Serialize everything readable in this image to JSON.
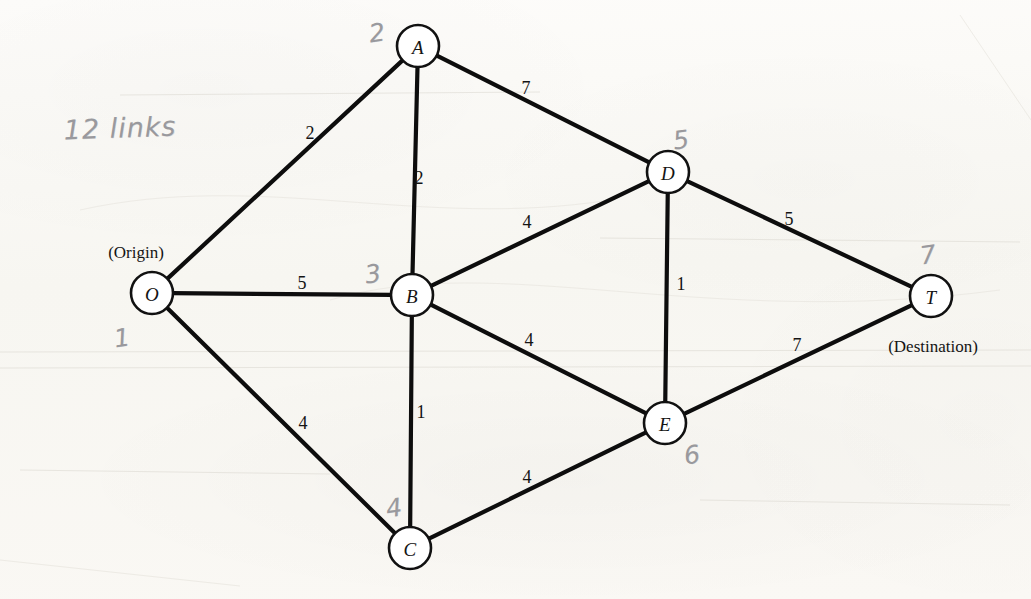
{
  "figure": {
    "type": "network-diagram",
    "paper_color": "#fbfaf7",
    "ink_color": "#0d0d0d",
    "pencil_color": "#8d8d92"
  },
  "annotations": {
    "note": "12 links",
    "note_x": 120,
    "note_y": 128
  },
  "nodes": [
    {
      "id": "O",
      "label": "O",
      "x": 152,
      "y": 293,
      "r": 21,
      "role": "(Origin)",
      "role_x": 136,
      "role_y": 252,
      "pencil": "1",
      "pencil_x": 122,
      "pencil_y": 338
    },
    {
      "id": "A",
      "label": "A",
      "x": 418,
      "y": 46,
      "r": 21,
      "role": "",
      "role_x": 0,
      "role_y": 0,
      "pencil": "2",
      "pencil_x": 377,
      "pencil_y": 33
    },
    {
      "id": "B",
      "label": "B",
      "x": 412,
      "y": 295,
      "r": 21,
      "role": "",
      "role_x": 0,
      "role_y": 0,
      "pencil": "3",
      "pencil_x": 373,
      "pencil_y": 274
    },
    {
      "id": "C",
      "label": "C",
      "x": 410,
      "y": 548,
      "r": 21,
      "role": "",
      "role_x": 0,
      "role_y": 0,
      "pencil": "4",
      "pencil_x": 394,
      "pencil_y": 508
    },
    {
      "id": "D",
      "label": "D",
      "x": 668,
      "y": 172,
      "r": 21,
      "role": "",
      "role_x": 0,
      "role_y": 0,
      "pencil": "5",
      "pencil_x": 681,
      "pencil_y": 140
    },
    {
      "id": "E",
      "label": "E",
      "x": 665,
      "y": 423,
      "r": 21,
      "role": "",
      "role_x": 0,
      "role_y": 0,
      "pencil": "6",
      "pencil_x": 692,
      "pencil_y": 455
    },
    {
      "id": "T",
      "label": "T",
      "x": 931,
      "y": 296,
      "r": 21,
      "role": "(Destination)",
      "role_x": 933,
      "role_y": 346,
      "pencil": "7",
      "pencil_x": 928,
      "pencil_y": 255
    }
  ],
  "edges": [
    {
      "from": "O",
      "to": "A",
      "weight": "2",
      "label_x": 310,
      "label_y": 133
    },
    {
      "from": "O",
      "to": "B",
      "weight": "5",
      "label_x": 302,
      "label_y": 283
    },
    {
      "from": "O",
      "to": "C",
      "weight": "4",
      "label_x": 303,
      "label_y": 423
    },
    {
      "from": "A",
      "to": "B",
      "weight": "2",
      "label_x": 419,
      "label_y": 178
    },
    {
      "from": "A",
      "to": "D",
      "weight": "7",
      "label_x": 526,
      "label_y": 88
    },
    {
      "from": "B",
      "to": "D",
      "weight": "4",
      "label_x": 527,
      "label_y": 222
    },
    {
      "from": "B",
      "to": "E",
      "weight": "4",
      "label_x": 529,
      "label_y": 340
    },
    {
      "from": "B",
      "to": "C",
      "weight": "1",
      "label_x": 421,
      "label_y": 412
    },
    {
      "from": "D",
      "to": "E",
      "weight": "1",
      "label_x": 681,
      "label_y": 284
    },
    {
      "from": "D",
      "to": "T",
      "weight": "5",
      "label_x": 789,
      "label_y": 219
    },
    {
      "from": "C",
      "to": "E",
      "weight": "4",
      "label_x": 527,
      "label_y": 477
    },
    {
      "from": "E",
      "to": "T",
      "weight": "7",
      "label_x": 797,
      "label_y": 345
    }
  ]
}
